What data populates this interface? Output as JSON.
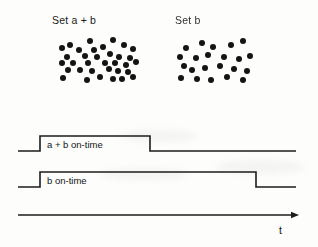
{
  "figure": {
    "title_labels": {
      "left_cluster": "Set a + b",
      "right_cluster": "Set b"
    },
    "axis": {
      "time_label": "t"
    },
    "waveforms": [
      {
        "name": "a-plus-b-on-time",
        "label": "a + b on-time",
        "rise_x": 40,
        "fall_x": 150,
        "baseline_y": 151,
        "high_y": 136,
        "start_x": 18,
        "end_x": 296
      },
      {
        "name": "b-on-time",
        "label": "b on-time",
        "rise_x": 40,
        "fall_x": 256,
        "baseline_y": 187,
        "high_y": 172,
        "start_x": 18,
        "end_x": 296
      }
    ],
    "time_axis": {
      "start_x": 18,
      "end_x": 299,
      "y": 215
    },
    "colors": {
      "ink": "#1c1c1c",
      "dot": "#141414",
      "background": "#fdfdfc"
    },
    "clusters": [
      {
        "name": "set-a-plus-b",
        "dot_count": 34,
        "dot_radius": 3.0,
        "dots": [
          [
            70,
            45
          ],
          [
            90,
            41
          ],
          [
            113,
            40
          ],
          [
            62,
            48
          ],
          [
            79,
            50
          ],
          [
            94,
            50
          ],
          [
            103,
            47
          ],
          [
            124,
            45
          ],
          [
            133,
            49
          ],
          [
            67,
            57
          ],
          [
            85,
            56
          ],
          [
            97,
            57
          ],
          [
            110,
            54
          ],
          [
            119,
            57
          ],
          [
            130,
            58
          ],
          [
            62,
            63
          ],
          [
            73,
            63
          ],
          [
            88,
            63
          ],
          [
            105,
            63
          ],
          [
            115,
            63
          ],
          [
            126,
            65
          ],
          [
            136,
            62
          ],
          [
            68,
            70
          ],
          [
            80,
            70
          ],
          [
            92,
            71
          ],
          [
            109,
            69
          ],
          [
            118,
            71
          ],
          [
            128,
            72
          ],
          [
            63,
            78
          ],
          [
            87,
            80
          ],
          [
            100,
            77
          ],
          [
            113,
            79
          ],
          [
            122,
            79
          ],
          [
            133,
            77
          ]
        ]
      },
      {
        "name": "set-b",
        "dot_count": 22,
        "dot_radius": 3.0,
        "dots": [
          [
            186,
            48
          ],
          [
            202,
            43
          ],
          [
            213,
            47
          ],
          [
            231,
            45
          ],
          [
            243,
            41
          ],
          [
            180,
            57
          ],
          [
            196,
            58
          ],
          [
            208,
            55
          ],
          [
            224,
            57
          ],
          [
            239,
            59
          ],
          [
            250,
            56
          ],
          [
            184,
            66
          ],
          [
            192,
            70
          ],
          [
            205,
            68
          ],
          [
            220,
            66
          ],
          [
            234,
            69
          ],
          [
            247,
            71
          ],
          [
            181,
            78
          ],
          [
            197,
            79
          ],
          [
            211,
            80
          ],
          [
            227,
            77
          ],
          [
            243,
            80
          ]
        ]
      }
    ]
  }
}
